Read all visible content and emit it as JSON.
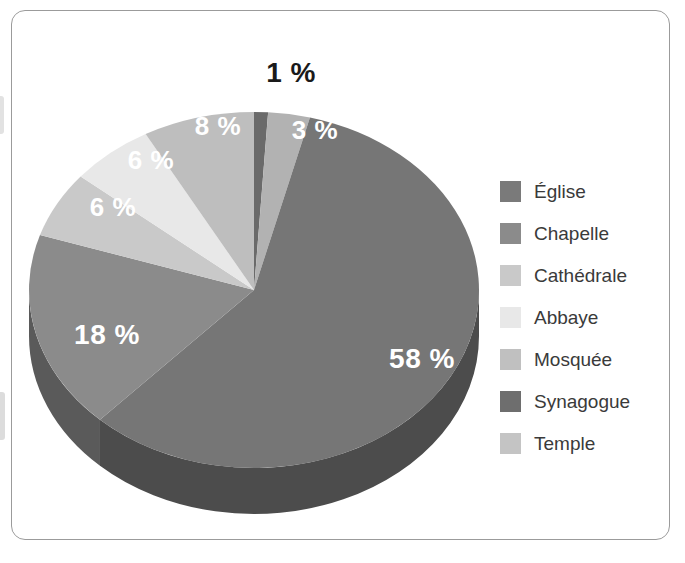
{
  "frame": {
    "border_color": "#9b9b9b",
    "background": "#ffffff"
  },
  "chart_data": {
    "type": "pie",
    "title": "",
    "subtitle": "",
    "xlabel": "",
    "ylabel": "",
    "three_d": true,
    "legend_position": "right",
    "grid": false,
    "value_suffix": " %",
    "start_angle_deg": 0,
    "direction": "clockwise",
    "categories": [
      "Église",
      "Chapelle",
      "Cathédrale",
      "Abbaye",
      "Mosquée",
      "Synagogue",
      "Temple"
    ],
    "values": [
      58,
      18,
      6,
      6,
      8,
      1,
      3
    ],
    "labels": [
      "58 %",
      "18 %",
      "6 %",
      "6 %",
      "8 %",
      "1 %",
      "3 %"
    ],
    "colors": [
      "#767676",
      "#8b8b8b",
      "#c9c9c9",
      "#e8e8e8",
      "#bebebe",
      "#6a6a6a",
      "#b2b2b2"
    ],
    "side_colors": [
      "#4c4c4c",
      "#5a5a5a",
      "#8a8a8a",
      "#a2a2a2",
      "#828282",
      "#464646",
      "#787878"
    ],
    "slice_order_clockwise_from_top": [
      "Synagogue",
      "Temple",
      "Église",
      "Chapelle",
      "Cathédrale",
      "Abbaye",
      "Mosquée"
    ],
    "label_colors": [
      "#ffffff",
      "#ffffff",
      "#ffffff",
      "#ffffff",
      "#ffffff",
      "#1a1a1a",
      "#ffffff"
    ]
  },
  "pie_labels": [
    {
      "text": "1 %",
      "x": 272,
      "y": 38,
      "size": 28,
      "color": "black"
    },
    {
      "text": "3 %",
      "x": 296,
      "y": 95,
      "size": 26,
      "color": "white"
    },
    {
      "text": "8 %",
      "x": 199,
      "y": 91,
      "size": 26,
      "color": "white"
    },
    {
      "text": "6 %",
      "x": 132,
      "y": 125,
      "size": 26,
      "color": "white"
    },
    {
      "text": "6 %",
      "x": 94,
      "y": 172,
      "size": 26,
      "color": "white"
    },
    {
      "text": "18 %",
      "x": 88,
      "y": 300,
      "size": 28,
      "color": "white"
    },
    {
      "text": "58 %",
      "x": 403,
      "y": 324,
      "size": 28,
      "color": "white"
    }
  ],
  "legend": {
    "items": [
      {
        "label": "Église",
        "color": "#7a7a7a"
      },
      {
        "label": "Chapelle",
        "color": "#8b8b8b"
      },
      {
        "label": "Cathédrale",
        "color": "#c9c9c9"
      },
      {
        "label": "Abbaye",
        "color": "#e8e8e8"
      },
      {
        "label": "Mosquée",
        "color": "#c0c0c0"
      },
      {
        "label": "Synagogue",
        "color": "#6e6e6e"
      },
      {
        "label": "Temple",
        "color": "#c4c4c4"
      }
    ]
  }
}
